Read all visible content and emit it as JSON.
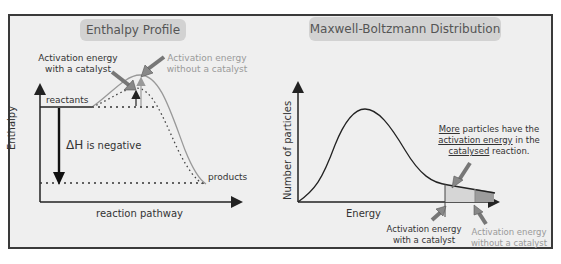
{
  "enthalpy_profile": {
    "title": "Enthalpy Profile",
    "y_axis_label": "Enthalpy",
    "x_axis_label": "reaction pathway",
    "reactants_label": "reactants",
    "products_label": "products",
    "delta_h_symbol": "ΔH",
    "delta_h_text": " is negative",
    "catalyst_label_line1": "Activation energy",
    "catalyst_label_line2": "with a catalyst",
    "no_catalyst_label_line1": "Activation energy",
    "no_catalyst_label_line2": "without a catalyst"
  },
  "maxwell_boltzmann": {
    "title": "Maxwell-Boltzmann Distribution",
    "y_axis_label": "Number of particles",
    "x_axis_label": "Energy",
    "note_word1": "More",
    "note_rest1": " particles have the",
    "note_word2": "activation energy",
    "note_rest2": " in the",
    "note_word3": "catalysed",
    "note_rest3": " reaction.",
    "catalyst_label_line1": "Activation energy",
    "catalyst_label_line2": "with a catalyst",
    "no_catalyst_label_line1": "Activation energy",
    "no_catalyst_label_line2": "without a catalyst"
  },
  "colors": {
    "frame_bg": "#efefef",
    "frame_border": "#3a3a3a",
    "pill_bg": "#d2d2d2",
    "line_dark": "#222222",
    "line_grey": "#999999",
    "shade_light": "#d6d6d6",
    "shade_dark": "#9c9c9c"
  }
}
